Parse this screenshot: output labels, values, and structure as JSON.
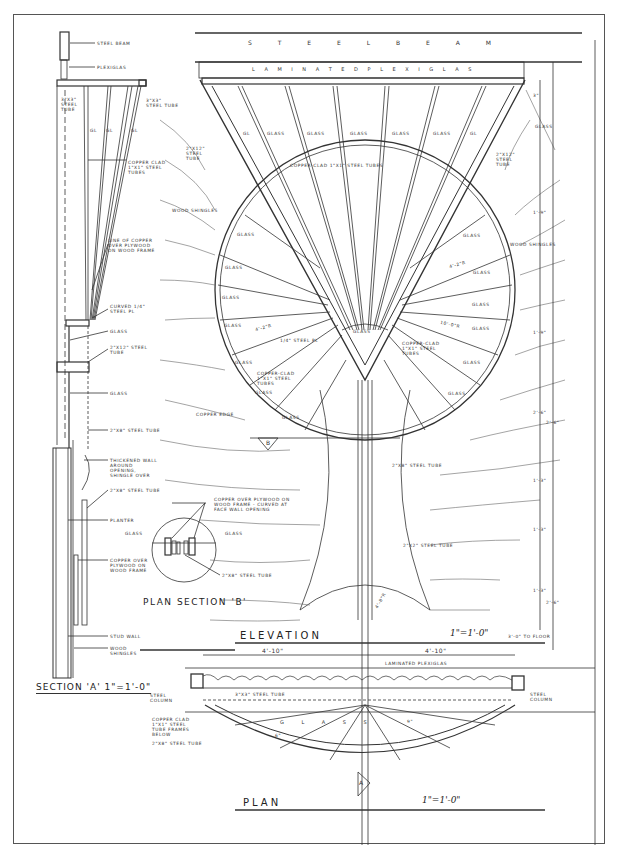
{
  "drawing": {
    "views": {
      "section_a": {
        "title": "SECTION 'A'",
        "scale": "1\"=1'-0\""
      },
      "plan_section_b": {
        "title": "PLAN SECTION 'B'"
      },
      "elevation": {
        "title": "ELEVATION",
        "scale": "1\"=1'-0\""
      },
      "plan": {
        "title": "PLAN",
        "scale": "1\"=1'-0\""
      }
    },
    "section_labels": [
      "STEEL BEAM",
      "PLEXIGLAS",
      "3\"x3\" STEEL TUBE",
      "3\"x3\" STEEL TUBE",
      "GL",
      "GL",
      "GL",
      "COPPER CLAD 1\"x1\" STEEL TUBES",
      "LINE OF COPPER OVER PLYWOOD ON WOOD FRAME",
      "CURVED 1/4\" STEEL PL",
      "GLASS",
      "2\"x12\" STEEL TUBE",
      "GLASS",
      "2\"x8\" STEEL TUBE",
      "THICKENED WALL AROUND OPENING, SHINGLE OVER",
      "2\"x8\" STEEL TUBE",
      "PLANTER",
      "COPPER OVER PLYWOOD ON WOOD FRAME",
      "STUD WALL",
      "WOOD SHINGLES"
    ],
    "plan_section_b_labels": [
      "COPPER OVER PLYWOOD ON WOOD FRAME - CURVED AT FACE WALL OPENING",
      "GLASS",
      "GLASS",
      "2\"x8\" STEEL TUBE"
    ],
    "elevation_labels": {
      "steel_beam": "S T E E L   B E A M",
      "laminated_plexiglas": "L A M I N A T E D      P L E X I G L A S",
      "top_glass": [
        "GL",
        "GLASS",
        "GLASS",
        "GLASS",
        "GLASS",
        "GLASS",
        "GL"
      ],
      "copper_clad": "COPPER-CLAD 1\"x1\" STEEL TUBES",
      "tube_left": "2\"x12\" STEEL TUBE",
      "tube_right": "2\"x12\" STEEL TUBE",
      "glass_right": "GLASS",
      "wood_shingles_left": "WOOD SHINGLES",
      "wood_shingles_right": "WOOD SHINGLES",
      "circle_glass": [
        "GLASS",
        "GLASS",
        "GLASS",
        "GLASS",
        "GLASS",
        "GLASS",
        "GLASS",
        "GLASS",
        "GLASS",
        "GLASS",
        "GLASS",
        "GLASS",
        "GLASS"
      ],
      "center_glass": "GLASS",
      "steel_pl": "1/4\" STEEL PL",
      "dim_left": "4'-2\"R",
      "dim_right_1": "4'-2\"R",
      "dim_right_2": "10'-0\"R",
      "copper_clad_tubes_left": "COPPER-CLAD 1\"x1\" STEEL TUBES",
      "copper_clad_tubes_right": "COPPER-CLAD 1\"x1\" STEEL TUBES",
      "copper_edge": "COPPER EDGE",
      "tube_2x8": "2\"x8\" STEEL TUBE",
      "tube_2x2": "2\"x2\" STEEL TUBE",
      "marker_b": "B",
      "radius": "4'-8\"R",
      "dims_right": [
        "3\"",
        "1'-9\"",
        "1'-9\"",
        "2'-6\"",
        "1'-3\"",
        "1'-3\"",
        "1'-3\"",
        "2'-6\"",
        "2'-6\""
      ],
      "floor_note": "3'-0\" TO FLOOR"
    },
    "plan_labels": {
      "dim_left": "4'-10\"",
      "dim_right": "4'-10\"",
      "laminated_plexiglas": "LAMINATED PLEXIGLAS",
      "steel_column_left": "STEEL COLUMN",
      "steel_column_right": "STEEL COLUMN",
      "tube_3x3": "3\"x3\" STEEL TUBE",
      "copper_clad": "COPPER CLAD 1\"x1\" STEEL TUBE FRAMES BELOW",
      "tube_2x8": "2\"x8\" STEEL TUBE",
      "glass": "G L A S S",
      "dim_inner": "9\"",
      "dim_inner_2": "6\"",
      "marker_a": "A"
    }
  }
}
